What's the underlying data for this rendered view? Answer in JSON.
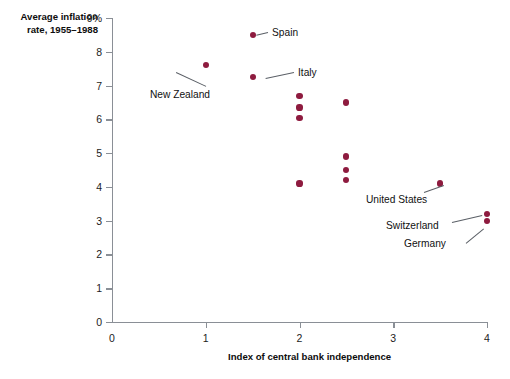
{
  "chart_data": {
    "type": "scatter",
    "title": "",
    "ylabel": "Average inflation rate, 1955–1988",
    "xlabel": "Index of central bank independence",
    "xlim": [
      0,
      4
    ],
    "ylim": [
      0,
      9
    ],
    "xticks": [
      "0",
      "1",
      "2",
      "3",
      "4"
    ],
    "yticks": [
      "0",
      "1",
      "2",
      "3",
      "4",
      "5",
      "6",
      "7",
      "8",
      "9%"
    ],
    "grid": false,
    "legend": "none",
    "point_color": "#8e1b3f",
    "axis_color": "#8a8f96",
    "points": [
      {
        "label": "New Zealand",
        "x": 1.0,
        "y": 7.6
      },
      {
        "label": "Spain",
        "x": 1.5,
        "y": 8.5
      },
      {
        "label": "Italy",
        "x": 1.5,
        "y": 7.25
      },
      {
        "label": "",
        "x": 2.0,
        "y": 6.7
      },
      {
        "label": "",
        "x": 2.0,
        "y": 6.35
      },
      {
        "label": "",
        "x": 2.0,
        "y": 6.05
      },
      {
        "label": "",
        "x": 2.0,
        "y": 4.1
      },
      {
        "label": "",
        "x": 2.5,
        "y": 6.5
      },
      {
        "label": "",
        "x": 2.5,
        "y": 4.9
      },
      {
        "label": "",
        "x": 2.5,
        "y": 4.5
      },
      {
        "label": "",
        "x": 2.5,
        "y": 4.2
      },
      {
        "label": "United States",
        "x": 3.5,
        "y": 4.1
      },
      {
        "label": "Switzerland",
        "x": 4.0,
        "y": 3.2
      },
      {
        "label": "Germany",
        "x": 4.0,
        "y": 3.0
      }
    ],
    "annotations": [
      {
        "name": "new-zealand",
        "text": "New Zealand",
        "text_x": 150,
        "text_y": 90,
        "line_x1": 206,
        "line_y1": 86,
        "line_x2": 176,
        "line_y2": 72
      },
      {
        "name": "spain",
        "text": "Spain",
        "text_x": 272,
        "text_y": 28,
        "line_x1": 268,
        "line_y1": 32,
        "line_x2": 256,
        "line_y2": 35
      },
      {
        "name": "italy",
        "text": "Italy",
        "text_x": 298,
        "text_y": 68,
        "line_x1": 294,
        "line_y1": 72,
        "line_x2": 266,
        "line_y2": 78
      },
      {
        "name": "united-states",
        "text": "United States",
        "text_x": 366,
        "text_y": 195,
        "line_x1": 424,
        "line_y1": 192,
        "line_x2": 444,
        "line_y2": 185
      },
      {
        "name": "switzerland",
        "text": "Switzerland",
        "text_x": 386,
        "text_y": 221,
        "line_x1": 452,
        "line_y1": 222,
        "line_x2": 482,
        "line_y2": 215
      },
      {
        "name": "germany",
        "text": "Germany",
        "text_x": 404,
        "text_y": 239,
        "line_x1": 466,
        "line_y1": 243,
        "line_x2": 484,
        "line_y2": 228
      }
    ]
  },
  "plot_geometry": {
    "origin_x": 112,
    "origin_y": 322,
    "x_span_px": 375,
    "y_span_px": 304
  }
}
